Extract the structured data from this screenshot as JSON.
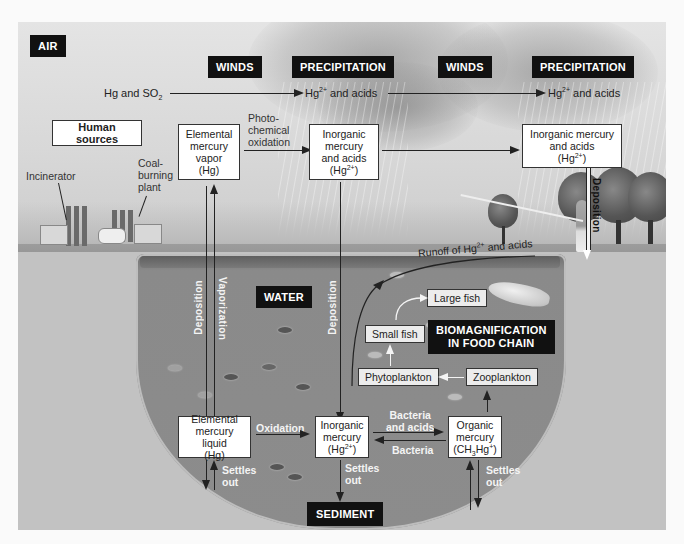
{
  "zones": {
    "air": "AIR",
    "water": "WATER",
    "sediment": "SEDIMENT"
  },
  "headers": [
    {
      "id": "winds-1",
      "label": "WINDS"
    },
    {
      "id": "precipitation-1",
      "label": "PRECIPITATION"
    },
    {
      "id": "winds-2",
      "label": "WINDS"
    },
    {
      "id": "precipitation-2",
      "label": "PRECIPITATION"
    }
  ],
  "air_flow": {
    "source": "Hg and SO",
    "source_sub": "2",
    "mid_prefix": "Hg",
    "mid_sup": "2+",
    "mid_suffix": " and acids",
    "end_prefix": "Hg",
    "end_sup": "2+",
    "end_suffix": " and acids"
  },
  "human_sources": {
    "title": "Human sources",
    "incinerator": "Incinerator",
    "coal_plant_lines": [
      "Coal-",
      "burning",
      "plant"
    ]
  },
  "boxes": {
    "elemental_vapor": [
      "Elemental",
      "mercury",
      "vapor",
      "(Hg)"
    ],
    "inorganic_air": {
      "lines": [
        "Inorganic",
        "mercury",
        "and acids"
      ],
      "formula_prefix": "(Hg",
      "formula_sup": "2+",
      "formula_suffix": ")"
    },
    "inorganic_right": {
      "lines": [
        "Inorganic mercury",
        "and acids"
      ],
      "formula_prefix": "(Hg",
      "formula_sup": "2+",
      "formula_suffix": ")"
    },
    "elemental_liquid": [
      "Elemental",
      "mercury liquid",
      "(Hg)"
    ],
    "inorganic_water": {
      "lines": [
        "Inorganic",
        "mercury"
      ],
      "formula_prefix": "(Hg",
      "formula_sup": "2+",
      "formula_suffix": ")"
    },
    "organic": {
      "lines": [
        "Organic",
        "mercury"
      ],
      "formula_a": "(CH",
      "formula_sub": "3",
      "formula_b": "Hg",
      "formula_sup": "+",
      "formula_c": ")"
    }
  },
  "process_labels": {
    "photochemical_oxidation": [
      "Photo-",
      "chemical",
      "oxidation"
    ],
    "deposition": "Deposition",
    "vaporization": "Vaporization",
    "oxidation": "Oxidation",
    "bacteria_and_acids": [
      "Bacteria",
      "and acids"
    ],
    "bacteria": "Bacteria",
    "settles_out": [
      "Settles",
      "out"
    ],
    "runoff_prefix": "Runoff of Hg",
    "runoff_sup": "2+",
    "runoff_suffix": " and acids"
  },
  "food_chain": {
    "title_lines": [
      "BIOMAGNIFICATION",
      "IN FOOD CHAIN"
    ],
    "large_fish": "Large fish",
    "small_fish": "Small fish",
    "phytoplankton": "Phytoplankton",
    "zooplankton": "Zooplankton"
  }
}
